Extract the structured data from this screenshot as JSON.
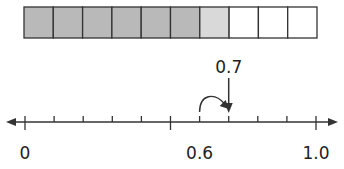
{
  "fraction_bar": {
    "total_cells": 10,
    "shaded_cells": 6,
    "highlighted_cells": 1,
    "colors": {
      "shaded": "#b9b9b9",
      "highlighted": "#d9d9d9",
      "empty": "#ffffff",
      "border": "#333333"
    }
  },
  "number_line": {
    "min": 0,
    "max": 1.0,
    "tick_count": 11,
    "major_tick_index": 5,
    "labels": [
      {
        "text": "0",
        "tick_index": 0
      },
      {
        "text": "0.6",
        "tick_index": 6
      },
      {
        "text": "1.0",
        "tick_index": 10
      }
    ],
    "jump_arrow": {
      "from_tick": 6,
      "to_tick": 7
    },
    "pointer": {
      "label": "0.7",
      "tick_index": 7
    }
  }
}
